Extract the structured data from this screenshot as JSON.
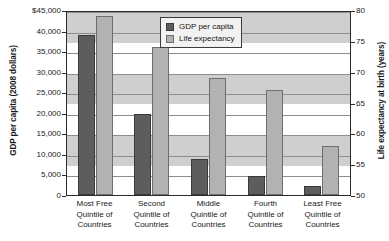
{
  "chart_data": {
    "type": "bar",
    "title": "",
    "xlabel": "",
    "ylabel": "GDP per capita (2008 dollars)",
    "y2label": "Life expectancy at birth (years)",
    "grid": true,
    "legend_position": "upper-right-inside",
    "categories": [
      "Most Free\nQuintile of\nCountries",
      "Second\nQuintile of\nCountries",
      "Middle\nQuintile of\nCountries",
      "Fourth\nQuintile of\nCountries",
      "Least Free\nQuintile of\nCountries"
    ],
    "category_lines": [
      [
        "Most Free",
        "Quintile of",
        "Countries"
      ],
      [
        "Second",
        "Quintile of",
        "Countries"
      ],
      [
        "Middle",
        "Quintile of",
        "Countries"
      ],
      [
        "Fourth",
        "Quintile of",
        "Countries"
      ],
      [
        "Least Free",
        "Quintile of",
        "Countries"
      ]
    ],
    "series": [
      {
        "name": "GDP per capita",
        "axis": "left",
        "color": "#5d5d5d",
        "values": [
          39000,
          19700,
          8800,
          4600,
          2300
        ]
      },
      {
        "name": "Life expectancy",
        "axis": "right",
        "color": "#b2b2b2",
        "values": [
          79.0,
          74.0,
          69.0,
          67.0,
          58.0
        ]
      }
    ],
    "ylim": [
      0,
      45000
    ],
    "ytick_step": 5000,
    "yticks": [
      45000,
      40000,
      35000,
      30000,
      25000,
      20000,
      15000,
      10000,
      5000,
      0
    ],
    "ytick_labels": [
      "$45,000",
      "40,000",
      "35,000",
      "30,000",
      "25,000",
      "20,000",
      "15,000",
      "10,000",
      "5,000",
      "0"
    ],
    "y2lim": [
      50,
      80
    ],
    "y2tick_step": 5,
    "y2ticks": [
      80,
      75,
      70,
      65,
      60,
      55,
      50
    ],
    "y2tick_labels": [
      "80",
      "75",
      "70",
      "65",
      "60",
      "55",
      "50"
    ]
  },
  "legend": {
    "items": [
      {
        "label": "GDP per capita",
        "swatch": "gdp"
      },
      {
        "label": "Life expectancy",
        "swatch": "life"
      }
    ]
  }
}
